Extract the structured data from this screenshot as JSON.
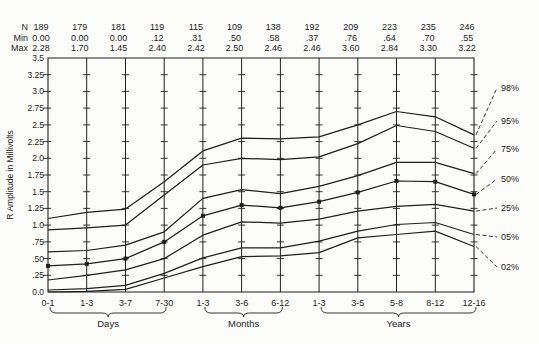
{
  "header": {
    "rows": [
      {
        "label": "N",
        "values": [
          "189",
          "179",
          "181",
          "119",
          "115",
          "109",
          "138",
          "192",
          "209",
          "223",
          "235",
          "246"
        ]
      },
      {
        "label": "Min",
        "values": [
          "0.00",
          "0.00",
          "0.00",
          ".12",
          ".31",
          ".50",
          ".58",
          ".37",
          ".76",
          ".64",
          ".70",
          ".55"
        ]
      },
      {
        "label": "Max",
        "values": [
          "2.28",
          "1.70",
          "1.45",
          "2.40",
          "2.42",
          "2.50",
          "2.46",
          "2.46",
          "3.60",
          "2.84",
          "3.30",
          "3.22"
        ]
      }
    ]
  },
  "chart_data": {
    "type": "line",
    "title": "",
    "ylabel": "R Amplitude in Millivolts",
    "xlabel": "",
    "ylim": [
      0,
      3.5
    ],
    "ytick_step": 0.25,
    "yticklabels": [
      "0.0",
      ".25",
      ".50",
      ".75",
      "1.0",
      "1.25",
      "1.5",
      "1.75",
      "2.0",
      "2.25",
      "2.5",
      "2.75",
      "3.0",
      "3.25",
      "3.5"
    ],
    "categories": [
      "0-1",
      "1-3",
      "3-7",
      "7-30",
      "1-3",
      "3-6",
      "6-12",
      "1-3",
      "3-5",
      "5-8",
      "8-12",
      "12-16"
    ],
    "groups": [
      {
        "label": "Days",
        "from": 0,
        "to": 3
      },
      {
        "label": "Months",
        "from": 4,
        "to": 6
      },
      {
        "label": "Years",
        "from": 7,
        "to": 11
      }
    ],
    "grid": "vertical-lines-with-quarter-ticks",
    "legend_position": "right",
    "series": [
      {
        "name": "98%",
        "values": [
          1.1,
          1.19,
          1.24,
          1.65,
          2.11,
          2.3,
          2.29,
          2.32,
          2.5,
          2.7,
          2.62,
          2.35
        ]
      },
      {
        "name": "95%",
        "values": [
          0.93,
          0.96,
          1.0,
          1.45,
          1.9,
          2.0,
          1.98,
          2.02,
          2.22,
          2.49,
          2.4,
          2.15
        ]
      },
      {
        "name": "75%",
        "values": [
          0.6,
          0.62,
          0.7,
          0.9,
          1.4,
          1.53,
          1.47,
          1.58,
          1.74,
          1.94,
          1.94,
          1.77
        ]
      },
      {
        "name": "50%",
        "values": [
          0.39,
          0.42,
          0.5,
          0.75,
          1.14,
          1.3,
          1.26,
          1.35,
          1.49,
          1.66,
          1.65,
          1.46
        ],
        "marker": "square"
      },
      {
        "name": "25%",
        "values": [
          0.18,
          0.25,
          0.33,
          0.5,
          0.85,
          1.05,
          1.03,
          1.09,
          1.21,
          1.28,
          1.31,
          1.21
        ]
      },
      {
        "name": "05%",
        "values": [
          0.03,
          0.05,
          0.1,
          0.28,
          0.51,
          0.66,
          0.66,
          0.76,
          0.91,
          1.01,
          1.04,
          0.86
        ]
      },
      {
        "name": "02%",
        "values": [
          0.0,
          0.01,
          0.04,
          0.21,
          0.38,
          0.53,
          0.54,
          0.59,
          0.81,
          0.86,
          0.91,
          0.68
        ]
      }
    ],
    "ink_color": "#1f1f1f",
    "background_color": "#fcfcfa"
  }
}
